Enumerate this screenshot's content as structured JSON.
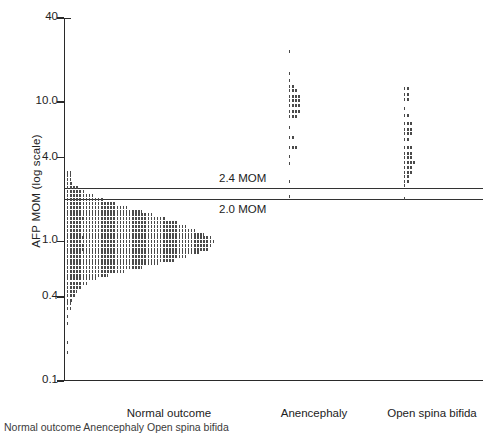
{
  "figure": {
    "caption": "Normal outcome                        Anencephaly            Open spina bifida"
  },
  "chart_data": {
    "type": "scatter",
    "title": "",
    "xlabel": "",
    "ylabel": "AFP MOM (log scale)",
    "yscale": "log",
    "ylim": [
      0.1,
      40
    ],
    "yticks": [
      40,
      10.0,
      4.0,
      1.0,
      0.4,
      0.1
    ],
    "ytick_labels": [
      "40",
      "10.0",
      "4.0",
      "1.0",
      "0.4",
      "0.1"
    ],
    "grid": false,
    "legend": "none",
    "categories": [
      "Normal outcome",
      "Anencephaly",
      "Open spina bifida"
    ],
    "annotations": [
      {
        "label": "2.4 MOM",
        "value": 2.4,
        "type": "hline"
      },
      {
        "label": "2.0 MOM",
        "value": 2.0,
        "type": "hline"
      }
    ],
    "series": [
      {
        "name": "Normal outcome",
        "plot_style": "horizontal-dot-histogram",
        "bins": [
          {
            "value": 3.1,
            "count": 2
          },
          {
            "value": 2.95,
            "count": 2
          },
          {
            "value": 2.8,
            "count": 2
          },
          {
            "value": 2.6,
            "count": 3
          },
          {
            "value": 2.45,
            "count": 6
          },
          {
            "value": 2.3,
            "count": 9
          },
          {
            "value": 2.15,
            "count": 13
          },
          {
            "value": 2.0,
            "count": 18
          },
          {
            "value": 1.88,
            "count": 24
          },
          {
            "value": 1.76,
            "count": 30
          },
          {
            "value": 1.65,
            "count": 36
          },
          {
            "value": 1.55,
            "count": 42
          },
          {
            "value": 1.45,
            "count": 48
          },
          {
            "value": 1.36,
            "count": 54
          },
          {
            "value": 1.28,
            "count": 58
          },
          {
            "value": 1.2,
            "count": 62
          },
          {
            "value": 1.13,
            "count": 66
          },
          {
            "value": 1.06,
            "count": 70
          },
          {
            "value": 1.0,
            "count": 72
          },
          {
            "value": 0.94,
            "count": 70
          },
          {
            "value": 0.88,
            "count": 68
          },
          {
            "value": 0.83,
            "count": 64
          },
          {
            "value": 0.78,
            "count": 58
          },
          {
            "value": 0.73,
            "count": 52
          },
          {
            "value": 0.69,
            "count": 44
          },
          {
            "value": 0.65,
            "count": 36
          },
          {
            "value": 0.61,
            "count": 28
          },
          {
            "value": 0.57,
            "count": 20
          },
          {
            "value": 0.54,
            "count": 14
          },
          {
            "value": 0.5,
            "count": 10
          },
          {
            "value": 0.47,
            "count": 7
          },
          {
            "value": 0.44,
            "count": 5
          },
          {
            "value": 0.41,
            "count": 4
          },
          {
            "value": 0.38,
            "count": 3
          },
          {
            "value": 0.36,
            "count": 2
          },
          {
            "value": 0.33,
            "count": 2
          },
          {
            "value": 0.29,
            "count": 1
          },
          {
            "value": 0.26,
            "count": 1
          },
          {
            "value": 0.19,
            "count": 1
          },
          {
            "value": 0.16,
            "count": 1
          }
        ]
      },
      {
        "name": "Anencephaly",
        "plot_style": "horizontal-dot-histogram",
        "bins": [
          {
            "value": 23.0,
            "count": 1
          },
          {
            "value": 16.0,
            "count": 1
          },
          {
            "value": 14.3,
            "count": 1
          },
          {
            "value": 13.0,
            "count": 2
          },
          {
            "value": 12.0,
            "count": 3
          },
          {
            "value": 11.0,
            "count": 4
          },
          {
            "value": 10.2,
            "count": 4
          },
          {
            "value": 9.4,
            "count": 4
          },
          {
            "value": 8.6,
            "count": 4
          },
          {
            "value": 7.9,
            "count": 3
          },
          {
            "value": 6.6,
            "count": 1
          },
          {
            "value": 5.6,
            "count": 2
          },
          {
            "value": 4.7,
            "count": 3
          },
          {
            "value": 4.1,
            "count": 1
          },
          {
            "value": 3.6,
            "count": 1
          },
          {
            "value": 2.7,
            "count": 1
          },
          {
            "value": 2.1,
            "count": 1
          }
        ]
      },
      {
        "name": "Open spina bifida",
        "plot_style": "horizontal-dot-histogram",
        "bins": [
          {
            "value": 12.5,
            "count": 2
          },
          {
            "value": 11.4,
            "count": 2
          },
          {
            "value": 10.4,
            "count": 2
          },
          {
            "value": 9.0,
            "count": 1
          },
          {
            "value": 8.0,
            "count": 2
          },
          {
            "value": 7.0,
            "count": 3
          },
          {
            "value": 6.4,
            "count": 3
          },
          {
            "value": 5.9,
            "count": 3
          },
          {
            "value": 5.4,
            "count": 2
          },
          {
            "value": 4.7,
            "count": 3
          },
          {
            "value": 4.3,
            "count": 3
          },
          {
            "value": 4.0,
            "count": 3
          },
          {
            "value": 3.7,
            "count": 4
          },
          {
            "value": 3.4,
            "count": 3
          },
          {
            "value": 3.1,
            "count": 3
          },
          {
            "value": 2.9,
            "count": 2
          },
          {
            "value": 2.7,
            "count": 2
          },
          {
            "value": 2.5,
            "count": 1
          },
          {
            "value": 2.05,
            "count": 1
          }
        ]
      }
    ],
    "group_centers_mom": {
      "Normal outcome": 0,
      "Anencephaly": 0,
      "Open spina bifida": 0
    }
  },
  "colors": {
    "axis": "#2a2a2a",
    "dot": "#4a4a4a",
    "reference_line": "#333333",
    "background": "#ffffff"
  }
}
